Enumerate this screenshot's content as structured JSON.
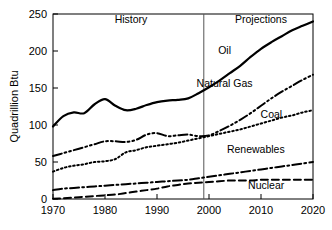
{
  "chart_data": {
    "type": "line",
    "title": "",
    "xlabel": "",
    "ylabel": "Quadrillion Btu",
    "xlim": [
      1970,
      2020
    ],
    "ylim": [
      0,
      250
    ],
    "xticks": [
      1970,
      1980,
      1990,
      2000,
      2010,
      2020
    ],
    "yticks": [
      0,
      50,
      100,
      150,
      200,
      250
    ],
    "grid": false,
    "legend_position": "inline-labels",
    "annotations": [
      {
        "name": "History",
        "text": "History",
        "x": 1985,
        "y": 238
      },
      {
        "name": "Projections",
        "text": "Projections",
        "x": 2010,
        "y": 238
      },
      {
        "name": "divider",
        "text": "",
        "x": 1999,
        "y": 0
      }
    ],
    "divider_year": 1999,
    "x": [
      1970,
      1972,
      1974,
      1976,
      1978,
      1980,
      1982,
      1984,
      1986,
      1988,
      1990,
      1992,
      1994,
      1996,
      1998,
      2000,
      2002,
      2004,
      2006,
      2008,
      2010,
      2012,
      2014,
      2016,
      2018,
      2020
    ],
    "series": [
      {
        "name": "Oil",
        "label": "Oil",
        "style": "solid",
        "width": 2.2,
        "label_x": 2003,
        "label_y": 196,
        "values": [
          98,
          112,
          117,
          116,
          128,
          135,
          126,
          120,
          122,
          127,
          131,
          133,
          134,
          136,
          143,
          151,
          160,
          170,
          180,
          192,
          203,
          212,
          220,
          228,
          234,
          240
        ]
      },
      {
        "name": "Natural Gas",
        "label": "Natural Gas",
        "style": "dashdotdot",
        "width": 2.0,
        "label_x": 2003,
        "label_y": 152,
        "values": [
          58,
          62,
          66,
          70,
          74,
          78,
          78,
          77,
          80,
          87,
          89,
          85,
          86,
          87,
          85,
          86,
          92,
          99,
          107,
          116,
          126,
          136,
          145,
          153,
          161,
          168
        ]
      },
      {
        "name": "Coal",
        "label": "Coal",
        "style": "dotted",
        "width": 2.0,
        "label_x": 2012,
        "label_y": 110,
        "values": [
          37,
          42,
          45,
          47,
          50,
          51,
          54,
          63,
          66,
          70,
          72,
          74,
          76,
          79,
          82,
          85,
          88,
          91,
          94,
          98,
          102,
          106,
          110,
          113,
          117,
          120
        ]
      },
      {
        "name": "Renewables",
        "label": "Renewables",
        "style": "dashdot",
        "width": 2.0,
        "label_x": 2009,
        "label_y": 62,
        "values": [
          12,
          14,
          15,
          16,
          17,
          18,
          19,
          20,
          21,
          22,
          23,
          24,
          25,
          26,
          28,
          30,
          32,
          34,
          36,
          38,
          40,
          42,
          44,
          46,
          48,
          50
        ]
      },
      {
        "name": "Nuclear",
        "label": "Nuclear",
        "style": "dashed",
        "width": 2.0,
        "label_x": 2011,
        "label_y": 14,
        "values": [
          0.3,
          1,
          2,
          3,
          4,
          5,
          6,
          8,
          10,
          12,
          14,
          17,
          19,
          21,
          22,
          23,
          24,
          25,
          25,
          25,
          26,
          26,
          26,
          26,
          26,
          26
        ]
      }
    ]
  }
}
